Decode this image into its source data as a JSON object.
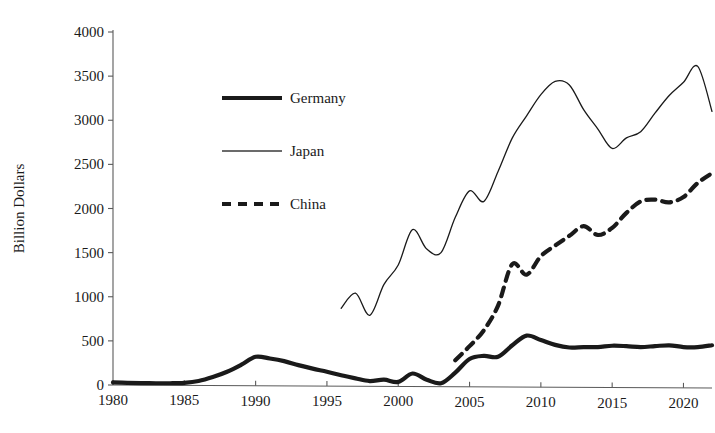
{
  "chart_data": {
    "type": "line",
    "title": "",
    "subtitle": "",
    "xlabel": "",
    "ylabel": "Billion Dollars",
    "xlim": [
      1980,
      2022
    ],
    "ylim": [
      0,
      4000
    ],
    "grid": false,
    "legend_position": "inside-upper-left",
    "x_ticks": [
      "1980",
      "1985",
      "1990",
      "1995",
      "2000",
      "2005",
      "2010",
      "2015",
      "2020"
    ],
    "x_tick_values": [
      1980,
      1985,
      1990,
      1995,
      2000,
      2005,
      2010,
      2015,
      2020
    ],
    "y_ticks": [
      "0",
      "500",
      "1000",
      "1500",
      "2000",
      "2500",
      "3000",
      "3500",
      "4000"
    ],
    "y_tick_values": [
      0,
      500,
      1000,
      1500,
      2000,
      2500,
      3000,
      3500,
      4000
    ],
    "series": [
      {
        "name": "Germany",
        "style": "solid-thick",
        "color": "#1a1a1a",
        "stroke_width": 4.2,
        "x": [
          1980,
          1981,
          1982,
          1983,
          1984,
          1985,
          1986,
          1987,
          1988,
          1989,
          1990,
          1991,
          1992,
          1993,
          1994,
          1995,
          1996,
          1997,
          1998,
          1999,
          2000,
          2001,
          2002,
          2003,
          2004,
          2005,
          2006,
          2007,
          2008,
          2009,
          2010,
          2011,
          2012,
          2013,
          2014,
          2015,
          2016,
          2017,
          2018,
          2019,
          2020,
          2021,
          2022
        ],
        "values": [
          30,
          25,
          22,
          20,
          20,
          25,
          45,
          90,
          150,
          230,
          320,
          300,
          270,
          225,
          185,
          150,
          110,
          75,
          45,
          60,
          35,
          130,
          60,
          20,
          140,
          295,
          330,
          320,
          450,
          560,
          510,
          455,
          425,
          430,
          430,
          445,
          440,
          430,
          440,
          450,
          430,
          430,
          450
        ]
      },
      {
        "name": "Japan",
        "style": "solid-thin",
        "color": "#3a3a3a",
        "stroke_width": 1.3,
        "x": [
          1996,
          1997,
          1998,
          1999,
          2000,
          2001,
          2002,
          2003,
          2004,
          2005,
          2006,
          2007,
          2008,
          2009,
          2010,
          2011,
          2012,
          2013,
          2014,
          2015,
          2016,
          2017,
          2018,
          2019,
          2020,
          2021,
          2022
        ],
        "values": [
          870,
          1040,
          790,
          1140,
          1360,
          1760,
          1540,
          1500,
          1900,
          2200,
          2080,
          2420,
          2800,
          3050,
          3290,
          3440,
          3400,
          3120,
          2900,
          2680,
          2800,
          2870,
          3080,
          3280,
          3430,
          3610,
          3100
        ]
      },
      {
        "name": "China",
        "style": "dashed",
        "color": "#1a1a1a",
        "stroke_width": 4.2,
        "x": [
          2004,
          2005,
          2006,
          2007,
          2008,
          2009,
          2010,
          2011,
          2012,
          2013,
          2014,
          2015,
          2016,
          2017,
          2018,
          2019,
          2020,
          2021,
          2022
        ],
        "values": [
          280,
          440,
          620,
          900,
          1370,
          1250,
          1460,
          1580,
          1690,
          1800,
          1700,
          1780,
          1950,
          2080,
          2100,
          2070,
          2130,
          2290,
          2400
        ]
      }
    ]
  },
  "legend": {
    "items": [
      {
        "label": "Germany",
        "style": "solid-thick"
      },
      {
        "label": "Japan",
        "style": "solid-thin"
      },
      {
        "label": "China",
        "style": "dashed"
      }
    ]
  },
  "axes": {
    "y_title": "Billion Dollars"
  }
}
